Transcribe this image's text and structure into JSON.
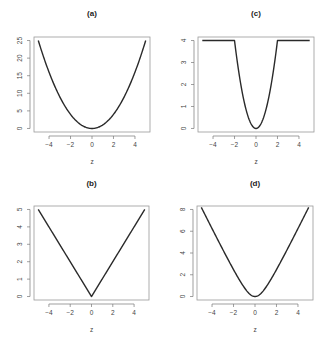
{
  "chart_data": [
    {
      "id": "a",
      "type": "line",
      "title": "(a)",
      "xlabel": "z",
      "ylabel": "",
      "function": "z^2",
      "xlim": [
        -5,
        5
      ],
      "ylim": [
        0,
        25
      ],
      "xticks": [
        -4,
        -2,
        0,
        2,
        4
      ],
      "yticks": [
        0,
        5,
        10,
        15,
        20,
        25
      ],
      "x": [
        -5,
        -4,
        -3,
        -2,
        -1,
        0,
        1,
        2,
        3,
        4,
        5
      ],
      "values": [
        25,
        16,
        9,
        4,
        1,
        0,
        1,
        4,
        9,
        16,
        25
      ],
      "grid": false,
      "position": "top-left"
    },
    {
      "id": "c",
      "type": "line",
      "title": "(c)",
      "xlabel": "z",
      "ylabel": "",
      "function": "min(z^2, 4)",
      "xlim": [
        -5,
        5
      ],
      "ylim": [
        0,
        4
      ],
      "xticks": [
        -4,
        -2,
        0,
        2,
        4
      ],
      "yticks": [
        0,
        1,
        2,
        3,
        4
      ],
      "x": [
        -5,
        -4,
        -3,
        -2,
        -1.5,
        -1,
        -0.5,
        0,
        0.5,
        1,
        1.5,
        2,
        3,
        4,
        5
      ],
      "values": [
        4,
        4,
        4,
        4,
        2.25,
        1,
        0.25,
        0,
        0.25,
        1,
        2.25,
        4,
        4,
        4,
        4
      ],
      "grid": false,
      "position": "top-right"
    },
    {
      "id": "b",
      "type": "line",
      "title": "(b)",
      "xlabel": "z",
      "ylabel": "",
      "function": "|z|",
      "xlim": [
        -5,
        5
      ],
      "ylim": [
        0,
        5
      ],
      "xticks": [
        -4,
        -2,
        0,
        2,
        4
      ],
      "yticks": [
        0,
        1,
        2,
        3,
        4,
        5
      ],
      "x": [
        -5,
        -4,
        -3,
        -2,
        -1,
        0,
        1,
        2,
        3,
        4,
        5
      ],
      "values": [
        5,
        4,
        3,
        2,
        1,
        0,
        1,
        2,
        3,
        4,
        5
      ],
      "grid": false,
      "position": "bottom-left"
    },
    {
      "id": "d",
      "type": "line",
      "title": "(d)",
      "xlabel": "z",
      "ylabel": "",
      "function": "2*(sqrt(1+z^2)-1)",
      "xlim": [
        -5,
        5
      ],
      "ylim": [
        0,
        8
      ],
      "xticks": [
        -4,
        -2,
        0,
        2,
        4
      ],
      "yticks": [
        0,
        2,
        4,
        6,
        8
      ],
      "x": [
        -5,
        -4,
        -3,
        -2,
        -1,
        0,
        1,
        2,
        3,
        4,
        5
      ],
      "values": [
        8.2,
        6.25,
        4.32,
        2.47,
        0.83,
        0,
        0.83,
        2.47,
        4.32,
        6.25,
        8.2
      ],
      "grid": false,
      "position": "bottom-right"
    }
  ],
  "panels": {
    "a": {
      "title": "(a)",
      "xlabel": "z"
    },
    "b": {
      "title": "(b)",
      "xlabel": "z"
    },
    "c": {
      "title": "(c)",
      "xlabel": "z"
    },
    "d": {
      "title": "(d)",
      "xlabel": "z"
    }
  }
}
